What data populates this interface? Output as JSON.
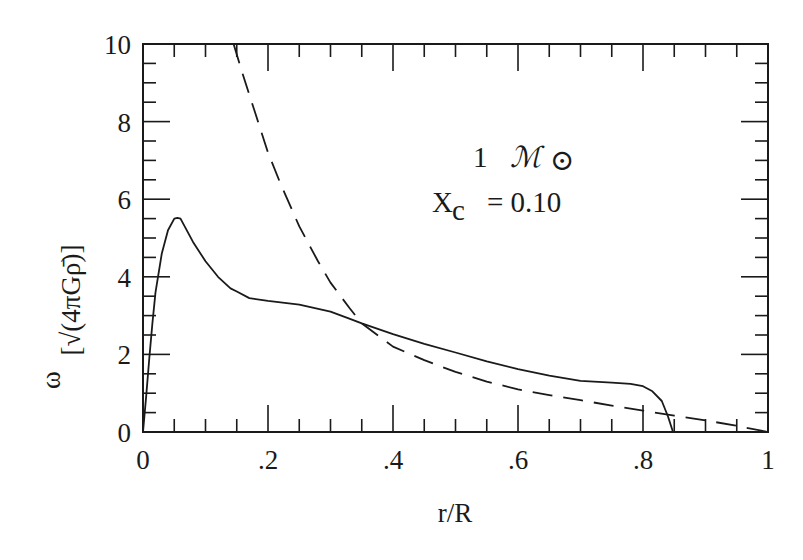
{
  "chart_data": {
    "type": "line",
    "title": "",
    "xlabel": "r/R",
    "ylabel_prefix": "ω",
    "ylabel_units": "[√(4πGρ̄)]",
    "xlim": [
      0,
      1
    ],
    "ylim": [
      0,
      10
    ],
    "grid": false,
    "legend": null,
    "x_ticks": [
      0,
      0.2,
      0.4,
      0.6,
      0.8,
      1
    ],
    "x_tick_labels": [
      "0",
      ".2",
      ".4",
      ".6",
      ".8",
      "1"
    ],
    "y_ticks": [
      0,
      2,
      4,
      6,
      8,
      10
    ],
    "y_tick_labels": [
      "0",
      "2",
      "4",
      "6",
      "8",
      "10"
    ],
    "annotations": [
      {
        "text": "1",
        "script": "ℳ",
        "sub": "⊙",
        "x": 0.6,
        "y": 7.9
      },
      {
        "text": "X",
        "sub": "c",
        "rest": "= 0.10",
        "x": 0.6,
        "y": 6.0
      }
    ],
    "series": [
      {
        "name": "solid",
        "style": "solid",
        "x": [
          0.0,
          0.005,
          0.01,
          0.015,
          0.02,
          0.03,
          0.04,
          0.05,
          0.055,
          0.06,
          0.065,
          0.08,
          0.1,
          0.12,
          0.14,
          0.15,
          0.17,
          0.2,
          0.25,
          0.3,
          0.33,
          0.35,
          0.4,
          0.45,
          0.5,
          0.55,
          0.6,
          0.65,
          0.7,
          0.75,
          0.78,
          0.8,
          0.815,
          0.83,
          0.84,
          0.848
        ],
        "y": [
          0.0,
          0.9,
          1.9,
          2.8,
          3.6,
          4.6,
          5.2,
          5.5,
          5.52,
          5.5,
          5.35,
          4.9,
          4.4,
          4.0,
          3.7,
          3.62,
          3.45,
          3.38,
          3.28,
          3.1,
          2.92,
          2.8,
          2.52,
          2.27,
          2.05,
          1.82,
          1.62,
          1.45,
          1.32,
          1.27,
          1.24,
          1.18,
          1.05,
          0.8,
          0.4,
          0.0
        ]
      },
      {
        "name": "dashed",
        "style": "dashed",
        "x": [
          0.145,
          0.16,
          0.18,
          0.2,
          0.22,
          0.25,
          0.28,
          0.3,
          0.33,
          0.35,
          0.4,
          0.45,
          0.5,
          0.55,
          0.6,
          0.65,
          0.7,
          0.75,
          0.8,
          0.85,
          0.9,
          0.95,
          1.0
        ],
        "y": [
          10.0,
          9.2,
          8.2,
          7.2,
          6.4,
          5.3,
          4.4,
          3.85,
          3.2,
          2.8,
          2.2,
          1.85,
          1.55,
          1.3,
          1.1,
          0.95,
          0.82,
          0.68,
          0.55,
          0.42,
          0.3,
          0.16,
          0.0
        ]
      }
    ]
  }
}
